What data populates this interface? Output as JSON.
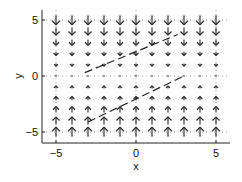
{
  "chart_data": {
    "type": "quiver",
    "title": "",
    "xlabel": "x",
    "ylabel": "y",
    "xlim": [
      -5.9,
      6.0
    ],
    "ylim": [
      -5.9,
      5.9
    ],
    "xticks": [
      -5,
      0,
      5
    ],
    "yticks": [
      -5,
      0,
      5
    ],
    "xtick_labels": [
      "−5",
      "0",
      "5"
    ],
    "ytick_labels": [
      "−5",
      "0",
      "5"
    ],
    "grid": "dotted at ticks",
    "field": {
      "description": "Direction field on an 11x11 grid from -5 to 5; arrows point toward y=0 (down above, up below) with magnitude growing with |y|",
      "x": [
        -5,
        -4,
        -3,
        -2,
        -1,
        0,
        1,
        2,
        3,
        4,
        5
      ],
      "y": [
        -5,
        -4,
        -3,
        -2,
        -1,
        0,
        1,
        2,
        3,
        4,
        5
      ]
    },
    "trajectories": [
      {
        "style": "dashed",
        "points": [
          [
            -3,
            -4.1
          ],
          [
            3,
            0
          ]
        ]
      },
      {
        "style": "dashed",
        "points": [
          [
            -3.2,
            0.3
          ],
          [
            2.6,
            3.7
          ]
        ]
      }
    ],
    "colors": {
      "arrows": "#222222",
      "axes": "#222222",
      "grid": "#888888",
      "background": "#ffffff"
    }
  }
}
